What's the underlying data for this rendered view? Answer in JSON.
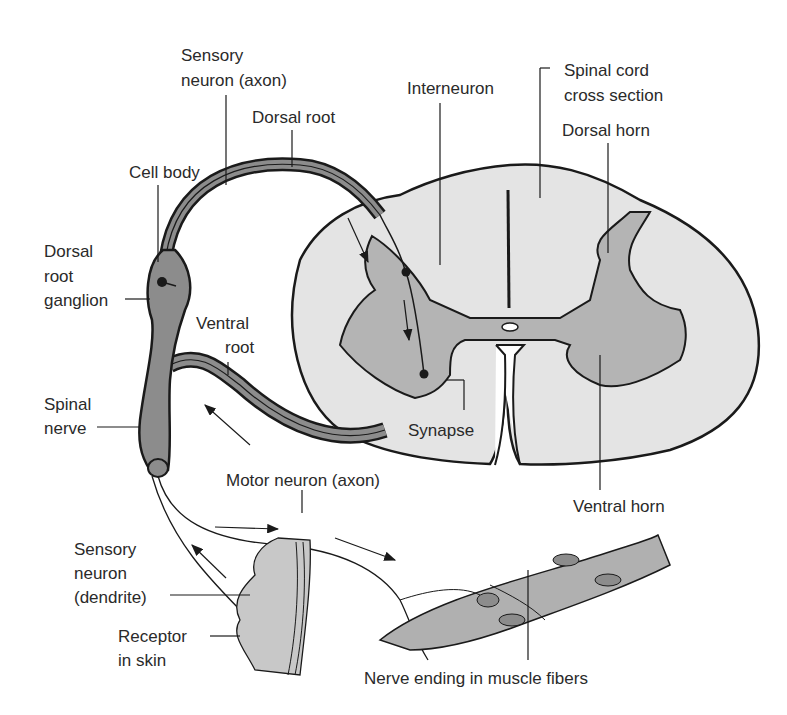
{
  "diagram": {
    "labels": {
      "sensory_axon_1": "Sensory",
      "sensory_axon_2": "neuron (axon)",
      "dorsal_root": "Dorsal root",
      "cell_body": "Cell body",
      "interneuron": "Interneuron",
      "spinal_cord_1": "Spinal cord",
      "spinal_cord_2": "cross section",
      "dorsal_horn": "Dorsal horn",
      "drg_1": "Dorsal",
      "drg_2": "root",
      "drg_3": "ganglion",
      "ventral_root_1": "Ventral",
      "ventral_root_2": "root",
      "spinal_nerve_1": "Spinal",
      "spinal_nerve_2": "nerve",
      "synapse": "Synapse",
      "motor_neuron": "Motor neuron (axon)",
      "ventral_horn": "Ventral horn",
      "sensory_dendrite_1": "Sensory",
      "sensory_dendrite_2": "neuron",
      "sensory_dendrite_3": "(dendrite)",
      "receptor_1": "Receptor",
      "receptor_2": "in skin",
      "nerve_ending": "Nerve ending in muscle fibers"
    },
    "colors": {
      "outline": "#1a1a1a",
      "white_matter": "#e4e4e4",
      "gray_matter": "#b4b4b4",
      "nerve_fill": "#8c8c8c",
      "muscle_fill": "#b0b0b0"
    }
  }
}
